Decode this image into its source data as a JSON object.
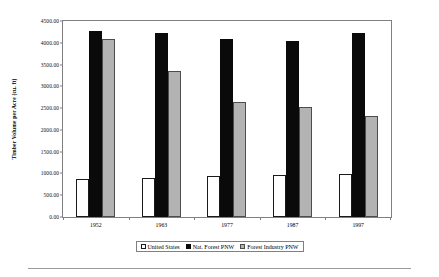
{
  "chart_data": {
    "type": "bar",
    "title": "",
    "xlabel": "",
    "ylabel": "Timber Volume per Acre (cu. ft)",
    "categories": [
      "1952",
      "1963",
      "1977",
      "1987",
      "1997"
    ],
    "ylim": [
      0,
      4500
    ],
    "ytick_step": 500,
    "ytick_labels": [
      "0.00",
      "500.00",
      "1000.00",
      "1500.00",
      "2000.00",
      "2500.00",
      "3000.00",
      "3500.00",
      "4000.00",
      "4500.00"
    ],
    "ytick_values": [
      0,
      500,
      1000,
      1500,
      2000,
      2500,
      3000,
      3500,
      4000,
      4500
    ],
    "grid": false,
    "legend_position": "bottom",
    "series": [
      {
        "name": "United States",
        "color": "#ffffff",
        "values": [
          860,
          880,
          940,
          950,
          975
        ]
      },
      {
        "name": "Nat. Forest PNW",
        "color": "#0a0a0a",
        "values": [
          4230,
          4180,
          4050,
          4000,
          4180
        ]
      },
      {
        "name": "Forest Industry PNW",
        "color": "#b3b3b3",
        "values": [
          4050,
          3320,
          2620,
          2500,
          2300
        ]
      }
    ]
  },
  "legend": {
    "items": [
      {
        "label": "United States"
      },
      {
        "label": "Nat. Forest PNW"
      },
      {
        "label": "Forest Industry PNW"
      }
    ]
  }
}
